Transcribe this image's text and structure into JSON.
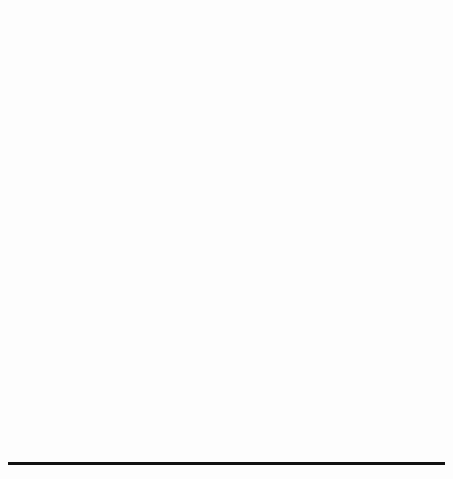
{
  "figure": {
    "panel_label": "(c)",
    "background": "#fdfdfd",
    "bottom_rule_color": "#111111"
  },
  "series_styles": {
    "CPS": {
      "color": "#3f3f3f",
      "marker": "circle",
      "dash": "1,2.4"
    },
    "CMPS": {
      "color": "#4a4a4a",
      "marker": "triangle",
      "dash": "4,2.6"
    },
    "FMPS": {
      "color": "#1d1d1d",
      "marker": "square",
      "dash": "none"
    }
  },
  "chart_data": [
    {
      "id": "top",
      "type": "line",
      "title": "",
      "xlabel": "Number of Rounds",
      "ylabel": "Objective: Energy Consumption",
      "xlim": [
        0,
        520
      ],
      "ylim": [
        0.063,
        0.0965
      ],
      "xticks": [
        0,
        100,
        200,
        300,
        400,
        500
      ],
      "yticks": [
        0.065,
        0.075,
        0.085,
        0.095
      ],
      "ytick_labels": [
        "0.065",
        "0.075",
        "0.085",
        "0.095"
      ],
      "grid": false,
      "legend_position": "left-lower",
      "legend_entries": [
        "CPS",
        "CMPS",
        "FMPS"
      ],
      "x": [
        50,
        100,
        150,
        200,
        250,
        300,
        350,
        400,
        450,
        500
      ],
      "series": [
        {
          "name": "CPS",
          "marker": "circle",
          "values": [
            0.0884,
            0.0868,
            0.0835,
            0.0827,
            0.082,
            0.0806,
            0.0794,
            0.0779,
            0.077,
            0.0761
          ]
        },
        {
          "name": "CMPS",
          "marker": "triangle",
          "values": [
            0.0915,
            0.0872,
            0.0838,
            0.0822,
            0.08,
            0.0784,
            0.0757,
            0.0729,
            0.0707,
            0.0678
          ]
        },
        {
          "name": "FMPS",
          "marker": "square",
          "values": [
            0.0925,
            0.086,
            0.0834,
            0.0821,
            0.082,
            0.082,
            0.082,
            0.082,
            0.082,
            0.082
          ]
        }
      ]
    },
    {
      "id": "bottom",
      "type": "line",
      "title": "",
      "xlabel": "Number of Rounds",
      "ylabel": "Fitness: Evaluations",
      "xlim": [
        -15,
        520
      ],
      "ylim": [
        -3,
        63
      ],
      "xticks": [
        0,
        100,
        200,
        300,
        400,
        500
      ],
      "yticks": [
        0,
        10,
        20,
        30,
        40,
        50,
        60
      ],
      "ytick_labels": [
        "0",
        "10",
        "20",
        "30",
        "40",
        "50",
        "60"
      ],
      "grid": false,
      "legend_position": "top-left",
      "legend_entries": [
        "CMPS",
        "CPS",
        "FMPS"
      ],
      "x": [
        0,
        50,
        100,
        150,
        200,
        250,
        300,
        350,
        400,
        450,
        500
      ],
      "series": [
        {
          "name": "CMPS",
          "marker": "square",
          "values": [
            0.2,
            4.9,
            9.9,
            14.8,
            19.6,
            24.7,
            29.6,
            34.4,
            39.5,
            44.3,
            50.4
          ]
        },
        {
          "name": "CPS",
          "marker": "circle",
          "values": [
            0.2,
            4.8,
            9.9,
            12.8,
            15.6,
            19.8,
            23.5,
            27.3,
            32.4,
            37.1,
            42.2
          ]
        },
        {
          "name": "FMPS",
          "marker": "triangle",
          "values": [
            0.2,
            4.9,
            9.9,
            14.9,
            19.1,
            21.9,
            26.8,
            30.6,
            35.4,
            40.5,
            45.4
          ]
        }
      ]
    }
  ]
}
